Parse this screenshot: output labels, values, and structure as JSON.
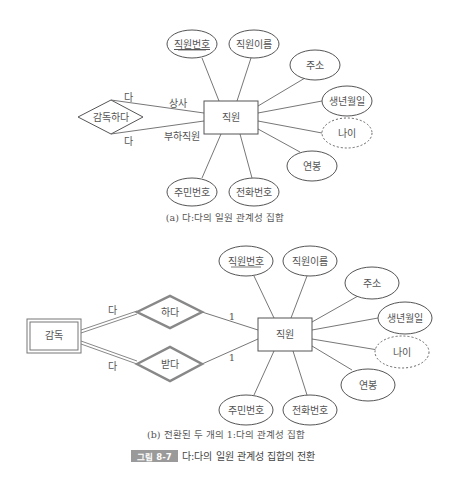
{
  "diagram_a": {
    "entity": "직원",
    "relationship": "감독하다",
    "role_upper": "상사",
    "role_lower": "부하직원",
    "card_upper": "다",
    "card_lower": "다",
    "attributes": {
      "emp_no": "직원번호",
      "emp_name": "직원이름",
      "address": "주소",
      "birth": "생년월일",
      "age": "나이",
      "salary": "연봉",
      "resident_no": "주민번호",
      "phone": "전화번호"
    },
    "caption": "(a) 다:다의 일원 관계성 집합"
  },
  "diagram_b": {
    "entity": "직원",
    "weak_entity": "감독",
    "rel_upper": "하다",
    "rel_lower": "받다",
    "card_weak_upper": "다",
    "card_weak_lower": "다",
    "card_entity_upper": "1",
    "card_entity_lower": "1",
    "attributes": {
      "emp_no": "직원번호",
      "emp_name": "직원이름",
      "address": "주소",
      "birth": "생년월일",
      "age": "나이",
      "salary": "연봉",
      "resident_no": "주민번호",
      "phone": "전화번호"
    },
    "caption": "(b) 전환된 두 개의 1:다의 관계성 집합"
  },
  "figure": {
    "label": "그림 8-7",
    "title": "다:다의 일원 관계성 집합의 전환",
    "label_bg": "#9a9a9a"
  }
}
